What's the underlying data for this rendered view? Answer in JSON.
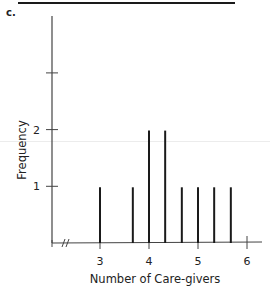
{
  "panel_label": "c.",
  "chart_data": {
    "type": "bar",
    "subtype": "line-plot (frequency spikes)",
    "title": "",
    "xlabel": "Number of Care-givers",
    "ylabel": "Frequency",
    "x": [
      3.0,
      3.67,
      4.0,
      4.33,
      4.67,
      5.0,
      5.33,
      5.67
    ],
    "values": [
      1,
      1,
      2,
      2,
      1,
      1,
      1,
      1
    ],
    "xticks": [
      "3",
      "4",
      "5",
      "6"
    ],
    "xtick_values": [
      3,
      4,
      5,
      6
    ],
    "yticks": [
      "1",
      "2",
      ""
    ],
    "ytick_values": [
      1,
      2,
      3
    ],
    "xlim": [
      2.0,
      6.2
    ],
    "ylim": [
      0,
      4
    ],
    "axis_break": "//",
    "grid": false,
    "legend": null,
    "bar_color": "#1a1a1a"
  }
}
